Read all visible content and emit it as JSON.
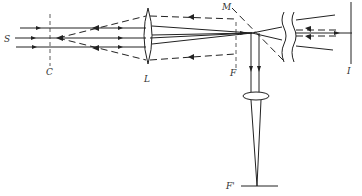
{
  "diagram": {
    "labels": {
      "source": "S",
      "condenser_plane": "C",
      "lens": "L",
      "mirror": "M",
      "focal_plane": "F",
      "image_plane": "I",
      "reflected_focal_plane": "F'"
    },
    "colors": {
      "ink": "#222222",
      "background": "#ffffff"
    }
  }
}
